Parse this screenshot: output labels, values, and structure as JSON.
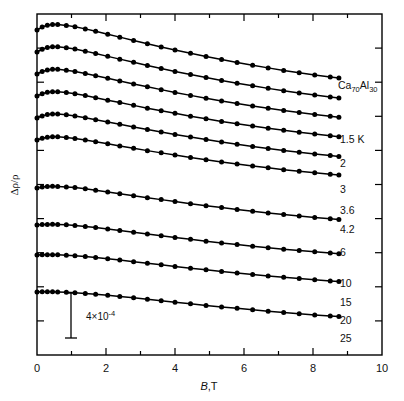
{
  "figure": {
    "sample_label": "Ca70Al30",
    "sample_label_parts": {
      "el1": "Ca",
      "sub1": "70",
      "el2": "Al",
      "sub2": "30"
    },
    "scale_bar_label": "4×10",
    "scale_bar_exponent": "-4",
    "scale_bar_value": 0.0004,
    "y_axis_label_main": "Δρ/ρ",
    "x_axis_label_symbol": "B",
    "x_axis_label_unit": ",T"
  },
  "chart_data": {
    "type": "line",
    "title": "",
    "subtitle": "",
    "xlabel": "B,T",
    "ylabel": "Δρ/ρ",
    "xlim": [
      0,
      10
    ],
    "xticks": [
      0,
      2,
      4,
      6,
      8,
      10
    ],
    "xtick_labels": [
      "0",
      "2",
      "4",
      "6",
      "8",
      "10"
    ],
    "xminor_ticks": [
      1,
      3,
      5,
      7,
      9
    ],
    "ylim_note": "arbitrary offset units; no numeric y ticks shown",
    "y_scale_bar": {
      "label": "4×10⁻⁴",
      "value": 0.0004
    },
    "grid": false,
    "legend_position": "right-inline-labels",
    "annotations": [
      {
        "text": "Ca70Al30",
        "x_px": 338,
        "y_px": 86
      },
      {
        "text": "4×10^-4",
        "x_px": 92,
        "y_px": 318
      }
    ],
    "marker": "filled-circle",
    "series": [
      {
        "name": "1.5 K",
        "label": "1.5 K",
        "x": [
          0.0,
          0.15,
          0.3,
          0.45,
          0.6,
          0.85,
          1.1,
          1.4,
          1.7,
          2.05,
          2.4,
          2.8,
          3.2,
          3.6,
          4.0,
          4.45,
          4.9,
          5.35,
          5.8,
          6.25,
          6.7,
          7.15,
          7.6,
          8.05,
          8.5,
          8.75
        ],
        "y": [
          0.0,
          0.45,
          0.73,
          0.85,
          0.84,
          0.7,
          0.49,
          0.17,
          -0.2,
          -0.64,
          -1.08,
          -1.58,
          -2.07,
          -2.56,
          -3.03,
          -3.53,
          -4.02,
          -4.48,
          -4.92,
          -5.34,
          -5.74,
          -6.12,
          -6.48,
          -6.81,
          -7.12,
          -7.29
        ]
      },
      {
        "name": "2 K",
        "label": "2",
        "x": [
          0.0,
          0.15,
          0.3,
          0.45,
          0.6,
          0.85,
          1.1,
          1.4,
          1.7,
          2.05,
          2.4,
          2.8,
          3.2,
          3.6,
          4.0,
          4.45,
          4.9,
          5.35,
          5.8,
          6.25,
          6.7,
          7.15,
          7.6,
          8.05,
          8.5,
          8.75
        ],
        "y": [
          0.0,
          0.42,
          0.69,
          0.8,
          0.79,
          0.65,
          0.44,
          0.13,
          -0.23,
          -0.66,
          -1.08,
          -1.56,
          -2.03,
          -2.49,
          -2.94,
          -3.42,
          -3.88,
          -4.32,
          -4.74,
          -5.13,
          -5.51,
          -5.87,
          -6.21,
          -6.53,
          -6.82,
          -6.98
        ]
      },
      {
        "name": "3 K",
        "label": "3",
        "x": [
          0.0,
          0.15,
          0.3,
          0.45,
          0.6,
          0.85,
          1.1,
          1.4,
          1.7,
          2.05,
          2.4,
          2.8,
          3.2,
          3.6,
          4.0,
          4.45,
          4.9,
          5.35,
          5.8,
          6.25,
          6.7,
          7.15,
          7.6,
          8.05,
          8.5,
          8.75
        ],
        "y": [
          0.0,
          0.38,
          0.62,
          0.72,
          0.71,
          0.58,
          0.39,
          0.09,
          -0.25,
          -0.65,
          -1.05,
          -1.5,
          -1.94,
          -2.37,
          -2.79,
          -3.24,
          -3.67,
          -4.08,
          -4.47,
          -4.84,
          -5.19,
          -5.52,
          -5.84,
          -6.13,
          -6.4,
          -6.55
        ]
      },
      {
        "name": "3.6 K",
        "label": "3.6",
        "x": [
          0.0,
          0.15,
          0.3,
          0.45,
          0.6,
          0.85,
          1.1,
          1.4,
          1.7,
          2.05,
          2.4,
          2.8,
          3.2,
          3.6,
          4.0,
          4.45,
          4.9,
          5.35,
          5.8,
          6.25,
          6.7,
          7.15,
          7.6,
          8.05,
          8.5,
          8.75
        ],
        "y": [
          0.0,
          0.35,
          0.57,
          0.66,
          0.65,
          0.53,
          0.35,
          0.07,
          -0.25,
          -0.63,
          -1.0,
          -1.42,
          -1.84,
          -2.24,
          -2.63,
          -3.06,
          -3.46,
          -3.85,
          -4.21,
          -4.56,
          -4.89,
          -5.2,
          -5.49,
          -5.77,
          -6.02,
          -6.16
        ]
      },
      {
        "name": "4.2 K",
        "label": "4.2",
        "x": [
          0.0,
          0.15,
          0.3,
          0.45,
          0.6,
          0.85,
          1.1,
          1.4,
          1.7,
          2.05,
          2.4,
          2.8,
          3.2,
          3.6,
          4.0,
          4.45,
          4.9,
          5.35,
          5.8,
          6.25,
          6.7,
          7.15,
          7.6,
          8.05,
          8.5,
          8.75
        ],
        "y": [
          0.0,
          0.32,
          0.52,
          0.6,
          0.59,
          0.48,
          0.31,
          0.05,
          -0.25,
          -0.6,
          -0.95,
          -1.35,
          -1.74,
          -2.12,
          -2.49,
          -2.89,
          -3.27,
          -3.63,
          -3.98,
          -4.31,
          -4.62,
          -4.91,
          -5.19,
          -5.45,
          -5.69,
          -5.82
        ]
      },
      {
        "name": "6 K",
        "label": "6",
        "x": [
          0.0,
          0.15,
          0.3,
          0.45,
          0.6,
          0.85,
          1.1,
          1.4,
          1.7,
          2.05,
          2.4,
          2.8,
          3.2,
          3.6,
          4.0,
          4.45,
          4.9,
          5.35,
          5.8,
          6.25,
          6.7,
          7.15,
          7.6,
          8.05,
          8.5,
          8.75
        ],
        "y": [
          0.0,
          0.26,
          0.42,
          0.49,
          0.48,
          0.39,
          0.24,
          0.01,
          -0.26,
          -0.58,
          -0.9,
          -1.26,
          -1.61,
          -1.95,
          -2.29,
          -2.65,
          -3.0,
          -3.33,
          -3.64,
          -3.94,
          -4.22,
          -4.49,
          -4.74,
          -4.98,
          -5.2,
          -5.32
        ]
      },
      {
        "name": "10 K",
        "label": "10",
        "x": [
          0.0,
          0.15,
          0.3,
          0.45,
          0.6,
          0.85,
          1.1,
          1.4,
          1.7,
          2.05,
          2.4,
          2.8,
          3.2,
          3.6,
          4.0,
          4.45,
          4.9,
          5.35,
          5.8,
          6.25,
          6.7,
          7.15,
          7.6,
          8.05,
          8.5,
          8.75
        ],
        "y": [
          0.0,
          0.14,
          0.22,
          0.25,
          0.24,
          0.17,
          0.06,
          -0.12,
          -0.33,
          -0.59,
          -0.86,
          -1.16,
          -1.47,
          -1.76,
          -2.05,
          -2.37,
          -2.68,
          -2.97,
          -3.25,
          -3.52,
          -3.77,
          -4.01,
          -4.24,
          -4.46,
          -4.66,
          -4.77
        ]
      },
      {
        "name": "15 K",
        "label": "15",
        "x": [
          0.0,
          0.15,
          0.3,
          0.45,
          0.6,
          0.85,
          1.1,
          1.4,
          1.7,
          2.05,
          2.4,
          2.8,
          3.2,
          3.6,
          4.0,
          4.45,
          4.9,
          5.35,
          5.8,
          6.25,
          6.7,
          7.15,
          7.6,
          8.05,
          8.5,
          8.75
        ],
        "y": [
          0.0,
          0.06,
          0.09,
          0.1,
          0.08,
          0.02,
          -0.07,
          -0.21,
          -0.39,
          -0.6,
          -0.83,
          -1.09,
          -1.36,
          -1.62,
          -1.88,
          -2.17,
          -2.45,
          -2.71,
          -2.97,
          -3.21,
          -3.44,
          -3.66,
          -3.87,
          -4.07,
          -4.26,
          -4.36
        ]
      },
      {
        "name": "20 K",
        "label": "20",
        "x": [
          0.0,
          0.15,
          0.3,
          0.45,
          0.6,
          0.85,
          1.1,
          1.4,
          1.7,
          2.05,
          2.4,
          2.8,
          3.2,
          3.6,
          4.0,
          4.45,
          4.9,
          5.35,
          5.8,
          6.25,
          6.7,
          7.15,
          7.6,
          8.05,
          8.5,
          8.75
        ],
        "y": [
          0.0,
          0.03,
          0.04,
          0.04,
          0.02,
          -0.03,
          -0.11,
          -0.23,
          -0.38,
          -0.57,
          -0.77,
          -1.01,
          -1.25,
          -1.49,
          -1.73,
          -1.99,
          -2.25,
          -2.49,
          -2.73,
          -2.95,
          -3.17,
          -3.37,
          -3.57,
          -3.76,
          -3.93,
          -4.02
        ]
      },
      {
        "name": "25 K",
        "label": "25",
        "x": [
          0.0,
          0.15,
          0.3,
          0.45,
          0.6,
          0.85,
          1.1,
          1.4,
          1.7,
          2.05,
          2.4,
          2.8,
          3.2,
          3.6,
          4.0,
          4.45,
          4.9,
          5.35,
          5.8,
          6.25,
          6.7,
          7.15,
          7.6,
          8.05,
          8.5,
          8.75
        ],
        "y": [
          0.0,
          0.02,
          0.02,
          0.02,
          0.0,
          -0.04,
          -0.11,
          -0.21,
          -0.34,
          -0.5,
          -0.68,
          -0.89,
          -1.11,
          -1.33,
          -1.55,
          -1.79,
          -2.03,
          -2.26,
          -2.48,
          -2.7,
          -2.9,
          -3.1,
          -3.29,
          -3.47,
          -3.64,
          -3.73
        ]
      }
    ],
    "series_offsets_px": [
      30,
      52,
      74,
      96,
      118,
      140,
      188,
      225,
      255,
      292
    ],
    "temperature_label_positions_px": [
      {
        "label": "1.5 K",
        "x": 340,
        "y": 143
      },
      {
        "label": "2",
        "x": 340,
        "y": 167
      },
      {
        "label": "3",
        "x": 340,
        "y": 193
      },
      {
        "label": "3.6",
        "x": 340,
        "y": 214
      },
      {
        "label": "4.2",
        "x": 340,
        "y": 233
      },
      {
        "label": "6",
        "x": 340,
        "y": 256
      },
      {
        "label": "10",
        "x": 340,
        "y": 287
      },
      {
        "label": "15",
        "x": 340,
        "y": 306
      },
      {
        "label": "20",
        "x": 340,
        "y": 324
      },
      {
        "label": "25",
        "x": 340,
        "y": 342
      }
    ]
  }
}
